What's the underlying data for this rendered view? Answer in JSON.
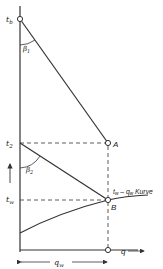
{
  "diagram": {
    "labels": {
      "tb": "t",
      "tb_sub": "b",
      "beta1": "β",
      "beta1_sub": "1",
      "t2": "t",
      "t2_sub": "2",
      "beta2": "β",
      "beta2_sub": "2",
      "tw": "t",
      "tw_sub": "w",
      "point_a": "A",
      "point_b": "B",
      "curve_label": "t",
      "curve_label_sub": "w",
      "curve_label_mid": " – q",
      "curve_label_sub2": "w",
      "curve_label_end": " Kurve",
      "q_axis": "q",
      "qw": "q",
      "qw_sub": "w"
    },
    "colors": {
      "line": "#333333",
      "background": "#ffffff"
    }
  }
}
